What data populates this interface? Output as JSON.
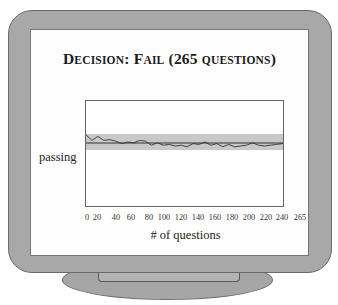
{
  "title": {
    "part1_initial": "D",
    "part1_rest": "ECISION",
    "colon": ": ",
    "part2_initial": "F",
    "part2_rest": "AIL",
    "paren_open": " (",
    "count": "265 ",
    "questions": "QUESTIONS",
    "paren_close": ")"
  },
  "chart_data": {
    "type": "line",
    "title": "Decision: Fail (265 questions)",
    "xlabel": "# of questions",
    "ylabel": "passing",
    "x_ticks": [
      "0",
      "20",
      "40",
      "60",
      "80",
      "100",
      "120",
      "140",
      "160",
      "180",
      "200",
      "220",
      "240",
      "265"
    ],
    "xlim": [
      0,
      265
    ],
    "grid": false,
    "legend": null,
    "passing_band": {
      "color": "#c8c8c8",
      "note": "shaded confidence band around passing line"
    },
    "passing_line": {
      "relative_y": 0.5
    },
    "series": [
      {
        "name": "estimate",
        "x": [
          0,
          8,
          16,
          24,
          32,
          40,
          48,
          56,
          64,
          72,
          80,
          88,
          96,
          104,
          112,
          120,
          128,
          136,
          144,
          152,
          160,
          168,
          176,
          184,
          192,
          200,
          208,
          216,
          224,
          232,
          240,
          248,
          256,
          265
        ],
        "values_relative_to_band": [
          0.95,
          0.6,
          0.85,
          0.6,
          0.65,
          0.55,
          0.4,
          0.5,
          0.45,
          0.6,
          0.55,
          0.3,
          0.45,
          0.3,
          0.35,
          0.25,
          0.3,
          0.2,
          0.4,
          0.35,
          0.5,
          0.3,
          0.4,
          0.2,
          0.35,
          0.2,
          0.25,
          0.3,
          0.45,
          0.3,
          0.25,
          0.3,
          0.35,
          0.4
        ]
      }
    ]
  },
  "labels": {
    "ylabel": "passing",
    "xlabel": "# of questions",
    "xticks": [
      "0",
      "20",
      "40",
      "60",
      "80",
      "100",
      "120",
      "140",
      "160",
      "180",
      "200",
      "220",
      "240",
      "265"
    ]
  },
  "colors": {
    "frame": "#a8a8a8",
    "band": "#c8c8c8",
    "line": "#333333"
  }
}
